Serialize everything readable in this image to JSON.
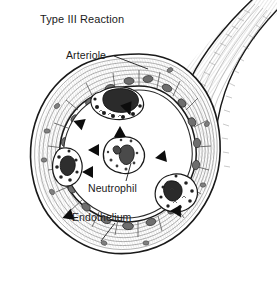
{
  "figure": {
    "title": "Type III Reaction",
    "type": "biomedical-illustration",
    "background_color": "#ffffff",
    "ink_color": "#1a1a1a",
    "labels": {
      "title": "Type III Reaction",
      "arteriole": "Arteriole",
      "neutrophil": "Neutrophil",
      "endothelium": "Endothelium"
    },
    "leader_lines": [
      {
        "name": "arteriole-leader",
        "from": [
          113,
          56
        ],
        "to": [
          146,
          68
        ]
      },
      {
        "name": "neutrophil-leader",
        "from": [
          126,
          181
        ],
        "to": [
          137,
          160
        ]
      },
      {
        "name": "endothelium-leader",
        "from": [
          114,
          224
        ],
        "to": [
          100,
          240
        ]
      }
    ],
    "arrowheads": [
      {
        "name": "arrowhead-lumen-top",
        "x": 120,
        "y": 132,
        "rotation": 90
      },
      {
        "name": "arrowhead-lumen-upper-left",
        "x": 94,
        "y": 150,
        "rotation": 135
      },
      {
        "name": "arrowhead-lumen-lower-left",
        "x": 88,
        "y": 172,
        "rotation": 135
      },
      {
        "name": "arrowhead-lumen-right",
        "x": 161,
        "y": 157,
        "rotation": 200
      },
      {
        "name": "arrowhead-wall-upper-left",
        "x": 79,
        "y": 123,
        "rotation": 155
      },
      {
        "name": "arrowhead-wall-top-right",
        "x": 127,
        "y": 110,
        "rotation": 250
      },
      {
        "name": "arrowhead-wall-lower-right",
        "x": 178,
        "y": 212,
        "rotation": 230
      },
      {
        "name": "arrowhead-wall-bottom-left",
        "x": 68,
        "y": 216,
        "rotation": 185
      }
    ],
    "neutrophil_cells": [
      {
        "name": "neutrophil-center",
        "cx": 123,
        "cy": 158,
        "label": "Neutrophil"
      },
      {
        "name": "neutrophil-top-wall",
        "cx": 110,
        "cy": 103,
        "label": ""
      },
      {
        "name": "neutrophil-left-wall",
        "cx": 68,
        "cy": 168,
        "label": ""
      },
      {
        "name": "neutrophil-right-wall",
        "cx": 176,
        "cy": 193,
        "label": ""
      }
    ]
  }
}
